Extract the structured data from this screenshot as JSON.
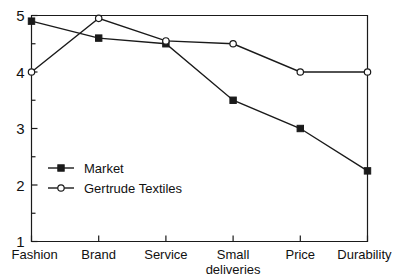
{
  "chart_data": {
    "type": "line",
    "title": "",
    "subtitle": "",
    "xlabel": "",
    "ylabel": "",
    "categories": [
      "Fashion",
      "Brand",
      "Service",
      "Small deliveries",
      "Price",
      "Durability"
    ],
    "category_lines": [
      [
        "Fashion"
      ],
      [
        "Brand"
      ],
      [
        "Service"
      ],
      [
        "Small",
        "deliveries"
      ],
      [
        "Price"
      ],
      [
        "Durability"
      ]
    ],
    "series": [
      {
        "name": "Market",
        "marker": "filled-square",
        "values": [
          4.9,
          4.6,
          4.5,
          3.5,
          3.0,
          2.25
        ]
      },
      {
        "name": "Gertrude Textiles",
        "marker": "open-circle",
        "values": [
          4.0,
          4.95,
          4.55,
          4.5,
          4.0,
          4.0
        ]
      }
    ],
    "ylim": [
      1,
      5
    ],
    "y_major_ticks": [
      1,
      2,
      3,
      4,
      5
    ],
    "y_minor_ticks": [
      1.5,
      2.5,
      3.5,
      4.5
    ],
    "y_tick_labels": [
      "1",
      "2",
      "3",
      "4",
      "5"
    ],
    "grid": false,
    "legend_position": "inside-lower-left",
    "colors": {
      "line": "#1a1a1a",
      "background": "#ffffff",
      "text": "#111111"
    }
  },
  "legend": {
    "entries": [
      {
        "label": "Market"
      },
      {
        "label": "Gertrude Textiles"
      }
    ]
  }
}
